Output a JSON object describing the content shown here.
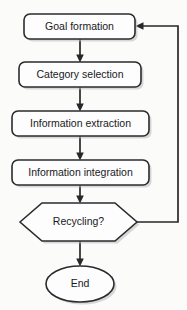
{
  "diagram": {
    "background_color": "#fbfbfa",
    "stroke_color": "#2b2b2f",
    "fill_color": "#fdfdfd",
    "text_color": "#19191c",
    "nodes": [
      {
        "id": "goal-formation",
        "label": "Goal formation",
        "shape": "rounded-rectangle",
        "x": 24,
        "y": 14,
        "width": 111,
        "height": 25,
        "rx": 6
      },
      {
        "id": "category-selection",
        "label": "Category selection",
        "shape": "rounded-rectangle",
        "x": 19,
        "y": 62,
        "width": 122,
        "height": 25,
        "rx": 6
      },
      {
        "id": "information-extraction",
        "label": "Information extraction",
        "shape": "rounded-rectangle",
        "x": 12,
        "y": 111,
        "width": 137,
        "height": 25,
        "rx": 6
      },
      {
        "id": "information-integration",
        "label": "Information integration",
        "shape": "rounded-rectangle",
        "x": 12,
        "y": 160,
        "width": 137,
        "height": 25,
        "rx": 6
      },
      {
        "id": "recycling-decision",
        "label": "Recycling?",
        "shape": "hexagon",
        "x": 20,
        "y": 203,
        "width": 117,
        "height": 38
      },
      {
        "id": "end-terminator",
        "label": "End",
        "shape": "ellipse",
        "cx": 80,
        "cy": 284,
        "rx": 34,
        "ry": 18
      }
    ],
    "connectors": [
      {
        "id": "goal-to-category",
        "from": "goal-formation",
        "to": "category-selection",
        "arrow": "down"
      },
      {
        "id": "category-to-extraction",
        "from": "category-selection",
        "to": "information-extraction",
        "arrow": "down"
      },
      {
        "id": "extraction-to-integration",
        "from": "information-extraction",
        "to": "information-integration",
        "arrow": "down"
      },
      {
        "id": "integration-to-recycling",
        "from": "information-integration",
        "to": "recycling-decision",
        "arrow": "down"
      },
      {
        "id": "recycling-to-end",
        "from": "recycling-decision",
        "to": "end-terminator",
        "arrow": "down"
      },
      {
        "id": "recycling-feedback-loop",
        "from": "recycling-decision",
        "to": "goal-formation",
        "arrow": "left",
        "path": "right-up-left"
      }
    ]
  }
}
